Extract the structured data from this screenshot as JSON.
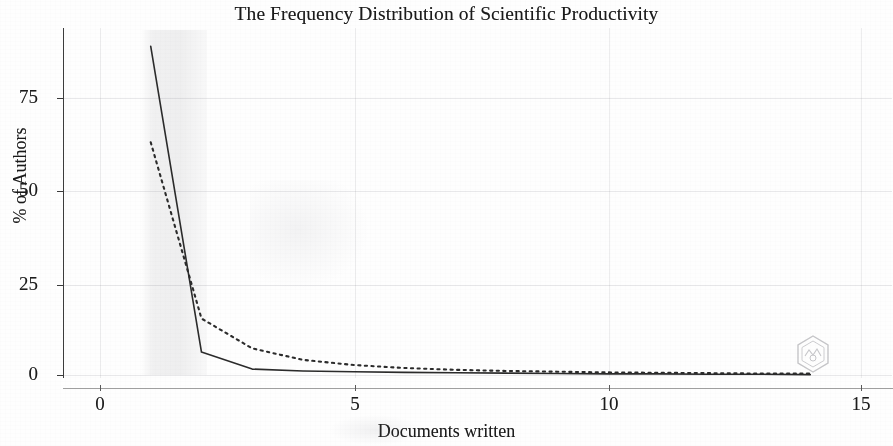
{
  "figure": {
    "title": "The Frequency Distribution of Scientific Productivity",
    "xlabel": "Documents written",
    "ylabel": "% of Authors",
    "watermark_icon": "hexagon-stamp-watermark"
  },
  "axes": {
    "y_ticks": [
      "0",
      "25",
      "50",
      "75"
    ],
    "x_ticks": [
      "0",
      "5",
      "10",
      "15"
    ]
  },
  "chart_data": {
    "type": "line",
    "title": "The Frequency Distribution of Scientific Productivity",
    "xlabel": "Documents written",
    "ylabel": "% of Authors",
    "xlim": [
      0,
      15
    ],
    "ylim": [
      0,
      90
    ],
    "xticks": [
      0,
      5,
      10,
      15
    ],
    "yticks": [
      0,
      25,
      50,
      75
    ],
    "grid": true,
    "legend": "none",
    "series": [
      {
        "name": "Observed distribution",
        "style": "solid",
        "color": "#2b2b2b",
        "x": [
          1,
          2,
          3,
          4,
          5,
          6,
          7,
          8,
          9,
          10,
          11,
          12,
          13,
          14
        ],
        "values": [
          89.0,
          6.2,
          1.6,
          1.1,
          0.9,
          0.7,
          0.6,
          0.5,
          0.4,
          0.3,
          0.3,
          0.2,
          0.2,
          0.1
        ]
      },
      {
        "name": "Lotka's law prediction",
        "style": "dotted",
        "color": "#2b2b2b",
        "x": [
          1,
          2,
          3,
          4,
          5,
          6,
          7,
          8,
          9,
          10,
          11,
          12,
          13,
          14
        ],
        "values": [
          63.0,
          15.3,
          7.2,
          4.1,
          2.7,
          1.9,
          1.4,
          1.1,
          0.9,
          0.7,
          0.6,
          0.5,
          0.4,
          0.4
        ]
      }
    ]
  }
}
